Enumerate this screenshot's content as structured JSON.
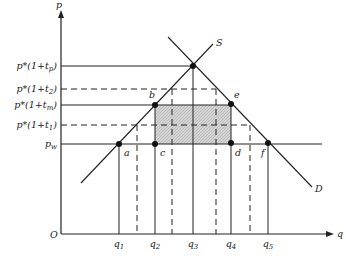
{
  "diagram": {
    "axes": {
      "y_label": "p",
      "x_label": "q",
      "origin": "O"
    },
    "price_levels": [
      {
        "id": "tp",
        "label": "p*(1+t",
        "sub": "p",
        "tail": ")",
        "y": 66,
        "style": "solid",
        "x_end": 193
      },
      {
        "id": "t2",
        "label": "p*(1+t",
        "sub": "2",
        "tail": ")",
        "y": 89,
        "style": "dashed",
        "x_end": 216
      },
      {
        "id": "tm",
        "label": "p*(1+t",
        "sub": "m",
        "tail": ")",
        "y": 105,
        "style": "solid",
        "x_end": 231
      },
      {
        "id": "t1",
        "label": "p*(1+t",
        "sub": "1",
        "tail": ")",
        "y": 125,
        "style": "dashed",
        "x_end": 250
      },
      {
        "id": "pw",
        "label": "p",
        "sub": "w",
        "tail": "",
        "y": 144,
        "style": "solid",
        "x_end": 322
      }
    ],
    "quantities": [
      {
        "label": "q",
        "sub": "1",
        "x": 119,
        "style": "solid",
        "y_top": 144
      },
      {
        "label": "",
        "sub": "",
        "x": 137,
        "style": "dashed",
        "y_top": 125
      },
      {
        "label": "q",
        "sub": "2",
        "x": 155,
        "style": "solid",
        "y_top": 105
      },
      {
        "label": "",
        "sub": "",
        "x": 172,
        "style": "dashed",
        "y_top": 89
      },
      {
        "label": "q",
        "sub": "3",
        "x": 193,
        "style": "solid",
        "y_top": 66
      },
      {
        "label": "",
        "sub": "",
        "x": 216,
        "style": "dashed",
        "y_top": 89
      },
      {
        "label": "q",
        "sub": "4",
        "x": 231,
        "style": "solid",
        "y_top": 104
      },
      {
        "label": "",
        "sub": "",
        "x": 250,
        "style": "dashed",
        "y_top": 125
      },
      {
        "label": "q",
        "sub": "5",
        "x": 268,
        "style": "solid",
        "y_top": 144
      }
    ],
    "points": [
      {
        "label": "a",
        "x": 119,
        "y": 144,
        "lx": 124,
        "ly": 156
      },
      {
        "label": "b",
        "x": 155,
        "y": 105,
        "lx": 149,
        "ly": 98
      },
      {
        "label": "c",
        "x": 155,
        "y": 144,
        "lx": 160,
        "ly": 156
      },
      {
        "label": "",
        "x": 193,
        "y": 66,
        "lx": 0,
        "ly": 0
      },
      {
        "label": "e",
        "x": 231,
        "y": 104,
        "lx": 234,
        "ly": 98
      },
      {
        "label": "d",
        "x": 231,
        "y": 143,
        "lx": 235,
        "ly": 156
      },
      {
        "label": "f",
        "x": 268,
        "y": 143,
        "lx": 261,
        "ly": 156
      }
    ],
    "curves": {
      "supply": {
        "label": "S",
        "x1": 81,
        "y1": 183,
        "x2": 213,
        "y2": 44
      },
      "demand": {
        "label": "D",
        "x1": 168,
        "y1": 37,
        "x2": 312,
        "y2": 187
      }
    },
    "shaded_region": {
      "x": 155,
      "y": 105,
      "w": 76,
      "h": 39,
      "color": "#d4d4d4"
    }
  }
}
